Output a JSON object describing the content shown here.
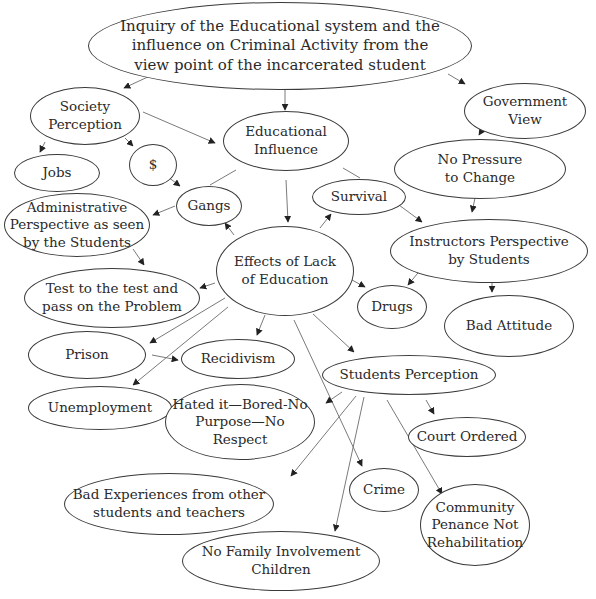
{
  "diagram": {
    "title": "Inquiry of the Educational system and the influence on Criminal Activity from the view point of the incarcerated student",
    "nodes": {
      "root": "Inquiry of the Educational system and the\ninfluence on Criminal Activity from the\nview point of the incarcerated student",
      "society_perception": "Society\nPerception",
      "government_view": "Government\nView",
      "educational_influence": "Educational\nInfluence",
      "dollar": "$",
      "jobs": "Jobs",
      "no_pressure": "No Pressure\nto Change",
      "gangs": "Gangs",
      "survival": "Survival",
      "administrative_perspective": "Administrative\nPerspective as seen\nby the Students",
      "instructors_perspective": "Instructors Perspective\nby Students",
      "effects_lack_education": "Effects of Lack\nof Education",
      "test_to_test": "Test to the test and\npass on the Problem",
      "drugs": "Drugs",
      "bad_attitude": "Bad Attitude",
      "prison": "Prison",
      "recidivism": "Recidivism",
      "students_perception": "Students Perception",
      "unemployment": "Unemployment",
      "hated_it": "Hated it—Bored-No\nPurpose—No Respect",
      "court_ordered": "Court Ordered",
      "bad_experiences": "Bad Experiences from other\nstudents and teachers",
      "crime": "Crime",
      "community_penance": "Community\nPenance Not\nRehabilitation",
      "no_family": "No Family Involvement\nChildren"
    },
    "edges": [
      [
        "root",
        "society_perception"
      ],
      [
        "root",
        "educational_influence"
      ],
      [
        "root",
        "government_view"
      ],
      [
        "society_perception",
        "jobs"
      ],
      [
        "society_perception",
        "dollar"
      ],
      [
        "society_perception",
        "educational_influence"
      ],
      [
        "dollar",
        "gangs"
      ],
      [
        "gangs",
        "administrative_perspective"
      ],
      [
        "educational_influence",
        "effects_lack_education"
      ],
      [
        "government_view",
        "no_pressure"
      ],
      [
        "no_pressure",
        "instructors_perspective"
      ],
      [
        "survival",
        "instructors_perspective"
      ],
      [
        "effects_lack_education",
        "gangs"
      ],
      [
        "effects_lack_education",
        "survival"
      ],
      [
        "administrative_perspective",
        "test_to_test"
      ],
      [
        "effects_lack_education",
        "test_to_test"
      ],
      [
        "effects_lack_education",
        "drugs"
      ],
      [
        "instructors_perspective",
        "drugs"
      ],
      [
        "instructors_perspective",
        "bad_attitude"
      ],
      [
        "effects_lack_education",
        "prison"
      ],
      [
        "effects_lack_education",
        "unemployment"
      ],
      [
        "effects_lack_education",
        "recidivism"
      ],
      [
        "prison",
        "recidivism"
      ],
      [
        "effects_lack_education",
        "students_perception"
      ],
      [
        "effects_lack_education",
        "crime"
      ],
      [
        "students_perception",
        "hated_it"
      ],
      [
        "students_perception",
        "court_ordered"
      ],
      [
        "students_perception",
        "bad_experiences"
      ],
      [
        "students_perception",
        "no_family"
      ],
      [
        "students_perception",
        "community_penance"
      ]
    ]
  }
}
